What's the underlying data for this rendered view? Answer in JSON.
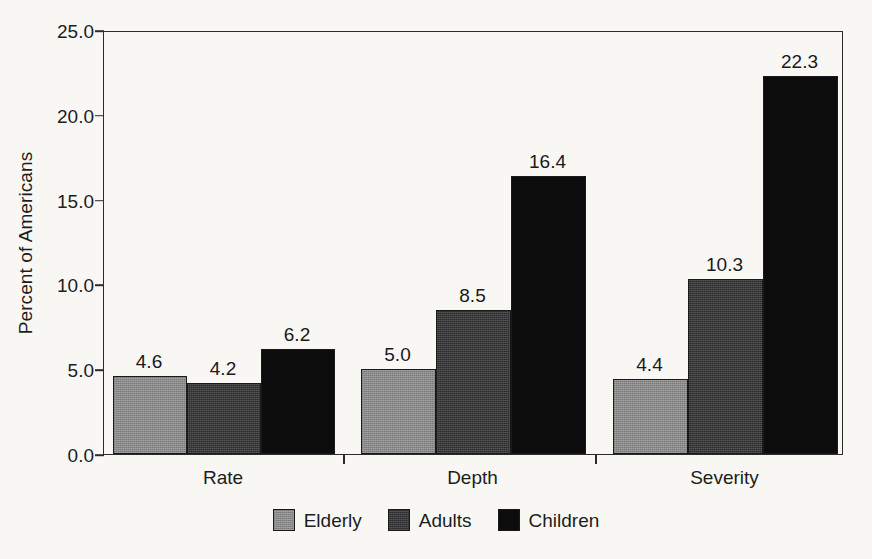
{
  "chart_data": {
    "type": "bar",
    "title": "",
    "xlabel": "",
    "ylabel": "Percent of Americans",
    "categories": [
      "Rate",
      "Depth",
      "Severity"
    ],
    "series": [
      {
        "name": "Elderly",
        "color": "#8a8a8a",
        "values": [
          4.6,
          5.0,
          4.4
        ]
      },
      {
        "name": "Adults",
        "color": "#2b2b2b",
        "values": [
          4.2,
          8.5,
          10.3
        ]
      },
      {
        "name": "Children",
        "color": "#0c0c0c",
        "values": [
          6.2,
          16.4,
          22.3
        ]
      }
    ],
    "value_labels": [
      [
        "4.6",
        "4.2",
        "6.2"
      ],
      [
        "5.0",
        "8.5",
        "16.4"
      ],
      [
        "4.4",
        "10.3",
        "22.3"
      ]
    ],
    "ylim": [
      0,
      25
    ],
    "ytick_values": [
      0,
      5,
      10,
      15,
      20,
      25
    ],
    "ytick_labels": [
      "0.0",
      "5.0",
      "10.0",
      "15.0",
      "20.0",
      "25.0"
    ],
    "grid": false,
    "legend_position": "bottom-center",
    "frame": true,
    "background_color": "#f8f7f4",
    "axis_color": "#2b2b2b"
  },
  "axis": {
    "y_title": "Percent of Americans"
  },
  "legend": {
    "items": [
      {
        "label": "Elderly"
      },
      {
        "label": "Adults"
      },
      {
        "label": "Children"
      }
    ]
  }
}
